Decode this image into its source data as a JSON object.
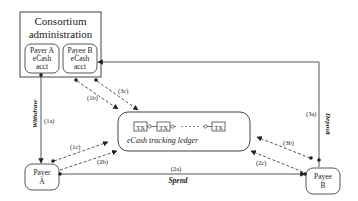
{
  "consortium": {
    "title_line1": "Consortium",
    "title_line2": "administration",
    "payer_acct": [
      "Payer A",
      "eCash",
      "acct"
    ],
    "payee_acct": [
      "Payee B",
      "eCash",
      "acct"
    ]
  },
  "ledger": {
    "label": "eCash tracking ledger",
    "tx_labels": [
      "TX",
      "TX",
      "TX"
    ]
  },
  "nodes": {
    "payer": [
      "Payer",
      "A"
    ],
    "payee": [
      "Payee",
      "B"
    ]
  },
  "edges": {
    "withdraw": "Withdraw",
    "deposit": "Deposit",
    "spend": "Spend",
    "step_1a": "(1a)",
    "step_1b": "(1b)",
    "step_1c": "(1c)",
    "step_2a": "(2a)",
    "step_2b": "(2b)",
    "step_2c": "(2c)",
    "step_3a": "(3a)",
    "step_3b": "(3b)",
    "step_3c": "(3c)"
  },
  "colors": {
    "stroke": "#333333",
    "background": "#ffffff"
  }
}
